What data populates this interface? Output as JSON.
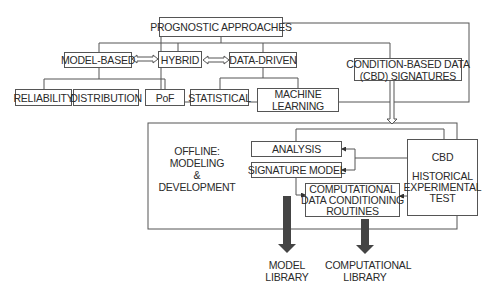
{
  "nodes": {
    "root": "PROGNOSTIC APPROACHES",
    "model_based": "MODEL-BASED",
    "hybrid": "HYBRID",
    "data_driven": "DATA-DRIVEN",
    "reliability": "RELIABILITY",
    "distribution": "DISTRIBUTION",
    "pof": "PoF",
    "statistical": "STATISTICAL",
    "machine_learning_1": "MACHINE",
    "machine_learning_2": "LEARNING",
    "cbd_signatures_1": "CONDITION-BASED DATA",
    "cbd_signatures_2": "(CBD) SIGNATURES",
    "offline_1": "OFFLINE:",
    "offline_2": "MODELING",
    "offline_3": "&",
    "offline_4": "DEVELOPMENT",
    "analysis": "ANALYSIS",
    "signature_model": "SIGNATURE MODEL",
    "comp_routines_1": "COMPUTATIONAL",
    "comp_routines_2": "DATA CONDITIONING",
    "comp_routines_3": "ROUTINES",
    "cbd_1": "CBD",
    "cbd_2": "HISTORICAL",
    "cbd_3": "EXPERIMENTAL",
    "cbd_4": "TEST",
    "model_library_1": "MODEL",
    "model_library_2": "LIBRARY",
    "comp_library_1": "COMPUTATIONAL",
    "comp_library_2": "LIBRARY"
  }
}
